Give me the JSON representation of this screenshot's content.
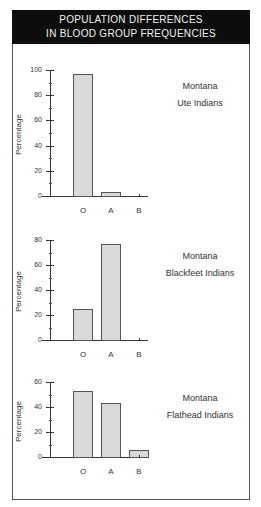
{
  "header": {
    "line1": "POPULATION DIFFERENCES",
    "line2": "IN BLOOD GROUP FREQUENCIES"
  },
  "chart_data": [
    {
      "type": "bar",
      "title": "Montana Ute Indians",
      "title_lines": [
        "Montana",
        "Ute Indians"
      ],
      "categories": [
        "O",
        "A",
        "B"
      ],
      "values": [
        97,
        3,
        0
      ],
      "xlabel": "",
      "ylabel": "Percentage",
      "ylim": [
        0,
        100
      ],
      "yticks": [
        "0",
        "20",
        "40",
        "60",
        "80",
        "100"
      ],
      "grid": false
    },
    {
      "type": "bar",
      "title": "Montana Blackfeet Indians",
      "title_lines": [
        "Montana",
        "Blackfeet Indians"
      ],
      "categories": [
        "O",
        "A",
        "B"
      ],
      "values": [
        25,
        77,
        0
      ],
      "xlabel": "",
      "ylabel": "Percentage",
      "ylim": [
        0,
        80
      ],
      "yticks": [
        "0",
        "20",
        "40",
        "60",
        "80"
      ],
      "grid": false
    },
    {
      "type": "bar",
      "title": "Montana Flathead Indians",
      "title_lines": [
        "Montana",
        "Flathead Indians"
      ],
      "categories": [
        "O",
        "A",
        "B"
      ],
      "values": [
        53,
        43,
        6
      ],
      "xlabel": "",
      "ylabel": "Percentage",
      "ylim": [
        0,
        60
      ],
      "yticks": [
        "0",
        "20",
        "40",
        "60"
      ],
      "grid": false
    }
  ],
  "colors": {
    "header_bg": "#0d0d0d",
    "header_text": "#f2f2f2",
    "bar_fill": "#d9d9d9",
    "bar_border": "#555555"
  }
}
